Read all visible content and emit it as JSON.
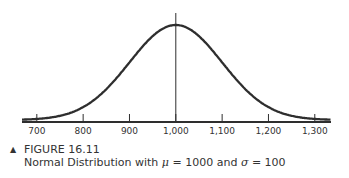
{
  "chart_data": {
    "type": "line",
    "title": "Normal Distribution with μ = 1000 and σ = 100",
    "figure_label": "FIGURE 16.11",
    "distribution": "normal",
    "mean": 1000,
    "std": 100,
    "x_ticks": [
      700,
      800,
      900,
      1000,
      1100,
      1200,
      1300
    ],
    "x_tick_labels": [
      "700",
      "800",
      "900",
      "1,000",
      "1,100",
      "1,200",
      "1,300"
    ],
    "xlim": [
      668,
      1335
    ],
    "xlabel": "",
    "ylabel": "",
    "mean_line": true,
    "grid": false,
    "legend": "none"
  },
  "caption": {
    "marker": "▲",
    "figure_label": "FIGURE 16.11",
    "line_prefix": "Normal Distribution with ",
    "mu_symbol": "μ",
    "mu_text": " = 1000 and ",
    "sigma_symbol": "σ",
    "sigma_text": " = 100"
  },
  "colors": {
    "curve": "#2e2e2e",
    "axis": "#2e2e2e",
    "text": "#333333"
  }
}
